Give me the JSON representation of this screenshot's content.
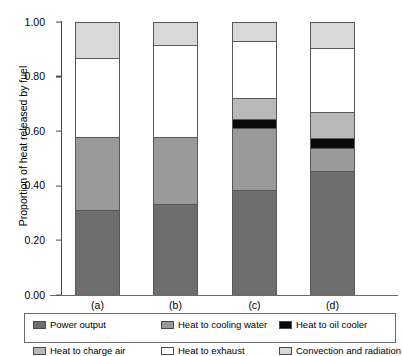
{
  "chart_data": {
    "type": "bar",
    "subtype": "stacked-bar",
    "title": "",
    "xlabel": "",
    "ylabel": "Proportion of heat released by fuel",
    "categories": [
      "(a)",
      "(b)",
      "(c)",
      "(d)"
    ],
    "ylim": [
      0.0,
      1.0
    ],
    "ytick_labels": [
      "0.00",
      "0.20",
      "0.40",
      "0.60",
      "0.80",
      "1.00"
    ],
    "ytick_values": [
      0.0,
      0.2,
      0.4,
      0.6,
      0.8,
      1.0
    ],
    "grid": false,
    "legend_position": "bottom",
    "stack_order_bottom_to_top": [
      "Power output",
      "Heat to cooling water",
      "Heat to oil cooler",
      "Heat to charge air",
      "Heat to exhaust",
      "Convection and radiation"
    ],
    "series": [
      {
        "name": "Power output",
        "color": "#6e6e6e",
        "values": [
          0.31,
          0.335,
          0.385,
          0.455
        ]
      },
      {
        "name": "Heat to cooling water",
        "color": "#9a9a9a",
        "values": [
          0.27,
          0.245,
          0.225,
          0.085
        ]
      },
      {
        "name": "Heat to oil cooler",
        "color": "#0a0a0a",
        "values": [
          0.0,
          0.0,
          0.035,
          0.035
        ]
      },
      {
        "name": "Heat to charge air",
        "color": "#b9b9b9",
        "values": [
          0.0,
          0.0,
          0.075,
          0.095
        ]
      },
      {
        "name": "Heat to exhaust",
        "color": "#ffffff",
        "values": [
          0.29,
          0.335,
          0.21,
          0.235
        ]
      },
      {
        "name": "Convection and radiation",
        "color": "#d8d8d8",
        "values": [
          0.13,
          0.085,
          0.07,
          0.095
        ]
      }
    ],
    "cumulative_tops": {
      "(a)": [
        0.31,
        0.58,
        0.58,
        0.58,
        0.87,
        1.0
      ],
      "(b)": [
        0.335,
        0.58,
        0.58,
        0.58,
        0.915,
        1.0
      ],
      "(c)": [
        0.385,
        0.61,
        0.645,
        0.72,
        0.93,
        1.0
      ],
      "(d)": [
        0.455,
        0.54,
        0.575,
        0.67,
        0.905,
        1.0
      ]
    }
  },
  "legend": {
    "entries": [
      {
        "label": "Power output",
        "color": "#6e6e6e"
      },
      {
        "label": "Heat to cooling water",
        "color": "#9a9a9a"
      },
      {
        "label": "Heat to oil cooler",
        "color": "#0a0a0a"
      },
      {
        "label": "Heat to charge air",
        "color": "#b9b9b9"
      },
      {
        "label": "Heat to exhaust",
        "color": "#ffffff"
      },
      {
        "label": "Convection and radiation",
        "color": "#d8d8d8"
      }
    ]
  }
}
